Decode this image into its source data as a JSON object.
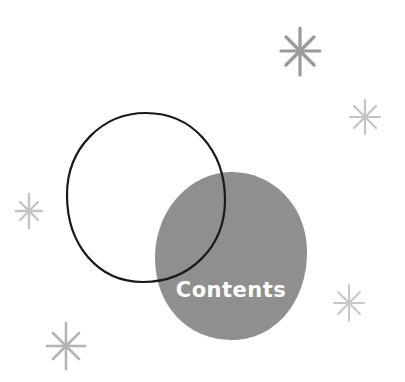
{
  "label": {
    "text": "Contents"
  },
  "colors": {
    "background": "#ffffff",
    "blob_fill": "#8f8f8f",
    "outline_stroke": "#1a1a1a",
    "sparkle_dark": "#9a9a9a",
    "sparkle_light": "#c4c4c4",
    "label_text": "#ffffff"
  },
  "shapes": {
    "outline_circle": {
      "cx": 146,
      "cy": 197,
      "rx": 79,
      "ry": 84
    },
    "filled_blob": {
      "cx": 231,
      "cy": 256,
      "rx": 76,
      "ry": 84
    }
  },
  "sparkles": [
    {
      "name": "sparkle-top-right",
      "cx": 300,
      "cy": 51,
      "r": 18,
      "color": "#9a9a9a"
    },
    {
      "name": "sparkle-right",
      "cx": 365,
      "cy": 117,
      "r": 15,
      "color": "#c4c4c4"
    },
    {
      "name": "sparkle-left",
      "cx": 29,
      "cy": 211,
      "r": 13,
      "color": "#c4c4c4"
    },
    {
      "name": "sparkle-bottom-right",
      "cx": 349,
      "cy": 303,
      "r": 15,
      "color": "#c4c4c4"
    },
    {
      "name": "sparkle-bottom-left",
      "cx": 66,
      "cy": 346,
      "r": 19,
      "color": "#b4b4b4"
    }
  ]
}
